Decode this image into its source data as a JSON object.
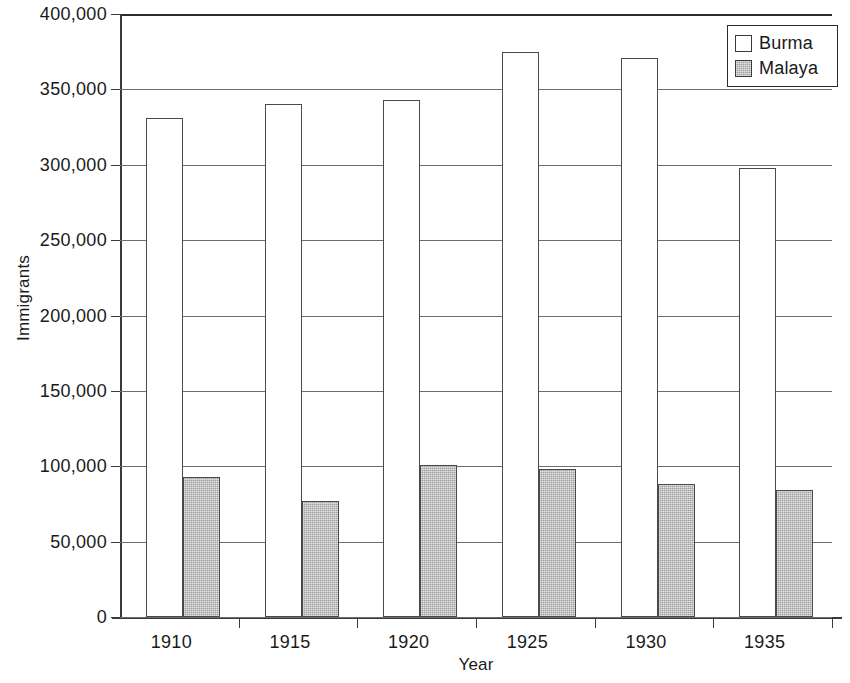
{
  "chart_data": {
    "type": "bar",
    "title": "",
    "xlabel": "Year",
    "ylabel": "Immigrants",
    "categories": [
      "1910",
      "1915",
      "1920",
      "1925",
      "1930",
      "1935"
    ],
    "series": [
      {
        "name": "Burma",
        "color": "#ffffff",
        "values": [
          331000,
          340000,
          343000,
          375000,
          371000,
          298000
        ]
      },
      {
        "name": "Malaya",
        "color": "#b6b6b6",
        "values": [
          93000,
          77000,
          101000,
          98000,
          88000,
          84000
        ]
      }
    ],
    "ylim": [
      0,
      400000
    ],
    "ytick_values": [
      0,
      50000,
      100000,
      150000,
      200000,
      250000,
      300000,
      350000,
      400000
    ],
    "ytick_labels": [
      "0",
      "50,000",
      "100,000",
      "150,000",
      "200,000",
      "250,000",
      "300,000",
      "350,000",
      "400,000"
    ],
    "grid": true,
    "grid_axis": "y",
    "legend": {
      "position": "top-right",
      "entries": [
        "Burma",
        "Malaya"
      ]
    }
  }
}
